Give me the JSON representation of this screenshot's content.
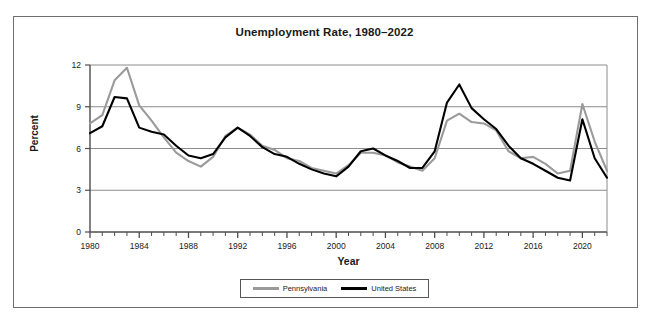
{
  "chart_data": {
    "type": "line",
    "title": "Unemployment Rate, 1980–2022",
    "xlabel": "Year",
    "ylabel": "Percent",
    "xlim": [
      1980,
      2022
    ],
    "ylim": [
      0,
      12
    ],
    "yticks": [
      0,
      3,
      6,
      9,
      12
    ],
    "xticks": [
      1980,
      1984,
      1988,
      1992,
      1996,
      2000,
      2004,
      2008,
      2012,
      2016,
      2020
    ],
    "xtick_labels": [
      "1980",
      "1984",
      "1988",
      "1992",
      "1996",
      "2000",
      "2004",
      "2008",
      "2012",
      "2016",
      "2020"
    ],
    "ytick_labels": [
      "0",
      "3",
      "6",
      "9",
      "12"
    ],
    "minor_xtick_interval": 1,
    "grid": "horizontal",
    "legend_position": "bottom-center",
    "x": [
      1980,
      1981,
      1982,
      1983,
      1984,
      1985,
      1986,
      1987,
      1988,
      1989,
      1990,
      1991,
      1992,
      1993,
      1994,
      1995,
      1996,
      1997,
      1998,
      1999,
      2000,
      2001,
      2002,
      2003,
      2004,
      2005,
      2006,
      2007,
      2008,
      2009,
      2010,
      2011,
      2012,
      2013,
      2014,
      2015,
      2016,
      2017,
      2018,
      2019,
      2020,
      2021,
      2022
    ],
    "series": [
      {
        "name": "Pennsylvania",
        "color": "#9a9a9a",
        "values": [
          7.8,
          8.4,
          10.9,
          11.8,
          9.1,
          8.0,
          6.8,
          5.7,
          5.1,
          4.7,
          5.4,
          6.9,
          7.5,
          7.0,
          6.2,
          5.9,
          5.3,
          5.1,
          4.6,
          4.4,
          4.2,
          4.8,
          5.7,
          5.7,
          5.5,
          5.0,
          4.7,
          4.4,
          5.3,
          8.0,
          8.5,
          7.9,
          7.8,
          7.3,
          5.8,
          5.3,
          5.4,
          4.9,
          4.2,
          4.4,
          9.2,
          6.5,
          4.4
        ]
      },
      {
        "name": "United States",
        "color": "#000000",
        "values": [
          7.1,
          7.6,
          9.7,
          9.6,
          7.5,
          7.2,
          7.0,
          6.2,
          5.5,
          5.3,
          5.6,
          6.8,
          7.5,
          6.9,
          6.1,
          5.6,
          5.4,
          4.9,
          4.5,
          4.2,
          4.0,
          4.7,
          5.8,
          6.0,
          5.5,
          5.1,
          4.6,
          4.6,
          5.8,
          9.3,
          10.6,
          8.9,
          8.1,
          7.4,
          6.2,
          5.3,
          4.9,
          4.4,
          3.9,
          3.7,
          8.1,
          5.3,
          3.9
        ]
      }
    ]
  },
  "legend": {
    "entries": [
      {
        "label": "Pennsylvania"
      },
      {
        "label": "United States"
      }
    ]
  }
}
